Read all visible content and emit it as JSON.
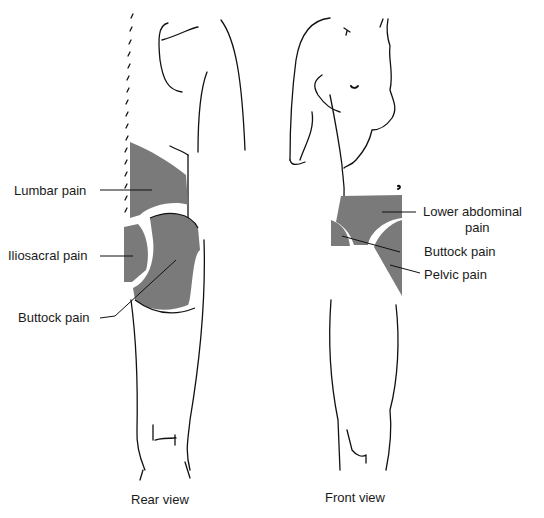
{
  "diagram": {
    "rear_view": {
      "caption": "Rear view",
      "regions": [
        {
          "id": "lumbar",
          "label": "Lumbar pain"
        },
        {
          "id": "iliosacral",
          "label": "Iliosacral pain"
        },
        {
          "id": "buttock",
          "label": "Buttock pain"
        }
      ]
    },
    "front_view": {
      "caption": "Front view",
      "regions": [
        {
          "id": "lower-abdominal",
          "label_line1": "Lower abdominal",
          "label_line2": "pain"
        },
        {
          "id": "buttock",
          "label": "Buttock pain"
        },
        {
          "id": "pelvic",
          "label": "Pelvic pain"
        }
      ]
    },
    "colors": {
      "region_fill": "#7a7a7a",
      "outline": "#111111",
      "background": "#ffffff"
    }
  }
}
